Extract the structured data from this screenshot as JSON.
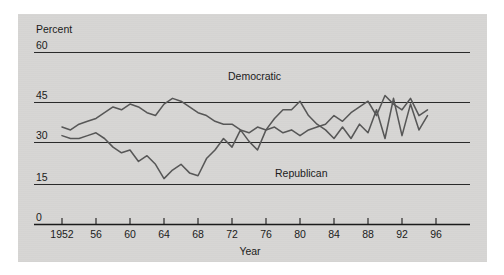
{
  "figure": {
    "background_color": "#d7d6d4",
    "page_color": "#ffffff",
    "line_color": "#575757",
    "axis_color": "#1b1b1b"
  },
  "chart_data": {
    "type": "line",
    "title": "",
    "subtitle": "",
    "xlabel": "Year",
    "ylabel": "Percent",
    "ylim": [
      0,
      60
    ],
    "xlim": [
      1951,
      1997
    ],
    "grid": true,
    "grid_axis": "y",
    "legend_position": "inline-annotation",
    "ytick_labels": [
      "0",
      "15",
      "30",
      "45",
      "60"
    ],
    "ytick_values": [
      0,
      15,
      30,
      45,
      60
    ],
    "xtick_labels": [
      "1952",
      "56",
      "60",
      "64",
      "68",
      "72",
      "76",
      "80",
      "84",
      "88",
      "92",
      "96"
    ],
    "xtick_values": [
      1952,
      1956,
      1960,
      1964,
      1968,
      1972,
      1976,
      1980,
      1984,
      1988,
      1992,
      1996
    ],
    "annotations": [
      {
        "text": "Democratic",
        "x": 1975,
        "y": 50
      },
      {
        "text": "Republican",
        "x": 1981.5,
        "y": 19
      }
    ],
    "x": [
      1952,
      1953,
      1954,
      1955,
      1956,
      1957,
      1958,
      1959,
      1960,
      1961,
      1962,
      1963,
      1964,
      1965,
      1966,
      1967,
      1968,
      1969,
      1970,
      1971,
      1972,
      1973,
      1974,
      1975,
      1976,
      1977,
      1978,
      1979,
      1980,
      1981,
      1982,
      1983,
      1984,
      1985,
      1986,
      1987,
      1988,
      1989,
      1990,
      1991,
      1992,
      1993,
      1994,
      1995
    ],
    "series": [
      {
        "name": "Democratic",
        "values": [
          34,
          33,
          35,
          36,
          37,
          39,
          41,
          40,
          42,
          41,
          39,
          38,
          42,
          44,
          43,
          41,
          39,
          38,
          36,
          35,
          35,
          33,
          32,
          34,
          33,
          34,
          32,
          33,
          31,
          33,
          34,
          35,
          38,
          36,
          39,
          41,
          43,
          38,
          45,
          42,
          40,
          44,
          38,
          40
        ]
      },
      {
        "name": "Republican",
        "values": [
          31,
          30,
          30,
          31,
          32,
          30,
          27,
          25,
          26,
          22,
          24,
          21,
          16,
          19,
          21,
          18,
          17,
          23,
          26,
          30,
          27,
          33,
          29,
          26,
          33,
          37,
          40,
          40,
          43,
          38,
          35,
          33,
          30,
          34,
          30,
          35,
          32,
          40,
          30,
          44,
          31,
          42,
          33,
          38
        ]
      }
    ]
  },
  "axes": {
    "y_unit_label": "Percent",
    "x_axis_title": "Year"
  }
}
